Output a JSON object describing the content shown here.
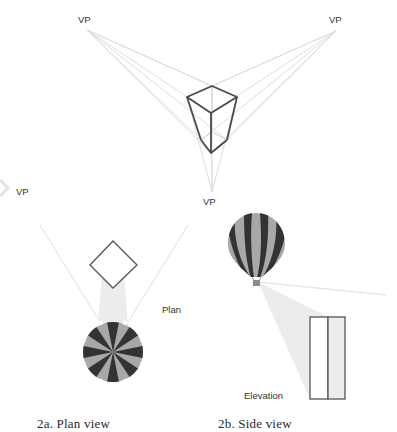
{
  "figure": {
    "three_point_perspective": {
      "vanishing_points": [
        {
          "label": "VP",
          "x": 87,
          "y": 30
        },
        {
          "label": "VP",
          "x": 336,
          "y": 31
        },
        {
          "label": "VP",
          "x": 212,
          "y": 192
        }
      ]
    },
    "plan_view": {
      "vp_label": "VP",
      "object_label": "Plan",
      "caption": "2a. Plan view"
    },
    "side_view": {
      "object_label": "Elevation",
      "caption": "2b. Side view"
    },
    "colors": {
      "outline": "#555555",
      "guide": "#dcdcdc",
      "balloon_dark": "#333333",
      "balloon_light": "#a8a8a8",
      "projection_fill": "#ececec"
    }
  }
}
